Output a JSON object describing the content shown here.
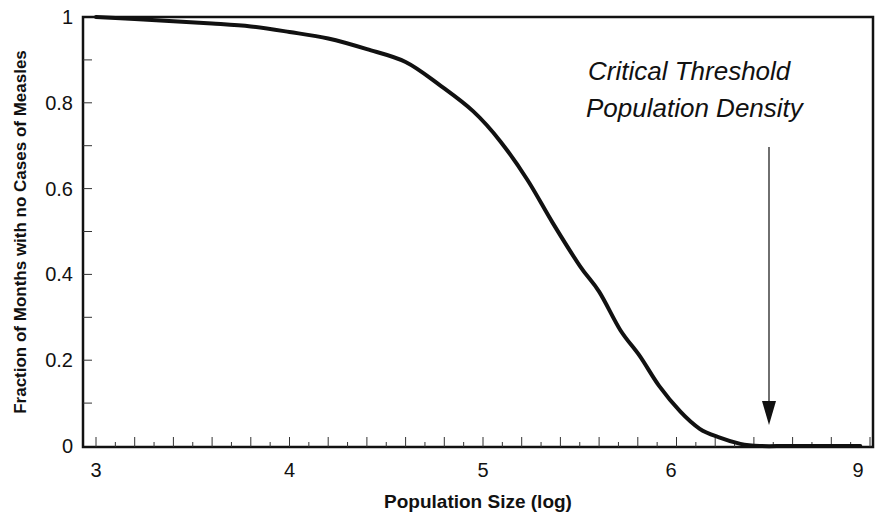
{
  "chart_data": {
    "type": "line",
    "title": "",
    "xlabel": "Population Size (log)",
    "ylabel": "Fraction of Months with no Cases of Measles",
    "xlim": [
      2.93,
      7.0
    ],
    "ylim": [
      0,
      1
    ],
    "x_tick_labels": [
      {
        "value": 3,
        "label": "3"
      },
      {
        "value": 4,
        "label": "4"
      },
      {
        "value": 5,
        "label": "5"
      },
      {
        "value": 6,
        "label": "6"
      },
      {
        "value": 6.95,
        "label": "9"
      }
    ],
    "y_ticks": [
      0,
      0.2,
      0.4,
      0.6,
      0.8,
      1
    ],
    "y_tick_labels": [
      "0",
      "0.2",
      "0.4",
      "0.6",
      "0.8",
      "1"
    ],
    "grid": false,
    "legend": null,
    "series": [
      {
        "name": "Fraction of months with no measles cases",
        "color": "#111111",
        "x": [
          3.0,
          3.2,
          3.4,
          3.6,
          3.8,
          4.0,
          4.2,
          4.4,
          4.6,
          4.78,
          4.95,
          5.09,
          5.23,
          5.36,
          5.5,
          5.6,
          5.71,
          5.81,
          5.91,
          6.02,
          6.12,
          6.22,
          6.33,
          6.43,
          6.6,
          6.95
        ],
        "values": [
          1.0,
          0.995,
          0.99,
          0.985,
          0.978,
          0.965,
          0.95,
          0.925,
          0.895,
          0.84,
          0.78,
          0.71,
          0.62,
          0.52,
          0.42,
          0.36,
          0.27,
          0.21,
          0.14,
          0.08,
          0.04,
          0.02,
          0.005,
          0.0,
          0.0,
          0.0
        ]
      }
    ],
    "annotations": [
      {
        "text_lines": [
          "Critical Threshold",
          "Population Density"
        ],
        "arrow": {
          "x": 6.5,
          "from_y": 0.7,
          "to_y": 0.05
        }
      }
    ]
  },
  "annotation": {
    "line1": "Critical Threshold",
    "line2": "Population Density"
  },
  "axes": {
    "xlabel": "Population Size (log)",
    "ylabel": "Fraction of Months with no Cases of Measles"
  }
}
